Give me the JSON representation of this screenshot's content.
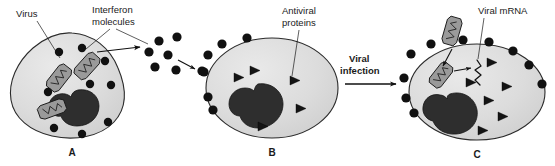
{
  "figure": {
    "background_color": "#ffffff",
    "width": 555,
    "height": 166
  },
  "labels": {
    "virus": "Virus",
    "interferon_line1": "Interferon",
    "interferon_line2": "molecules",
    "antiviral_line1": "Antiviral",
    "antiviral_line2": "proteins",
    "viral_infection_line1": "Viral",
    "viral_infection_line2": "infection",
    "viral_mrna": "Viral mRNA"
  },
  "panels": [
    {
      "letter": "A",
      "name": "infected-cell-producing-interferon",
      "cytoplasm_color": "#d9d9d9",
      "nucleus_color": "#2e2e2e",
      "virus_count": 3,
      "interferon_dot_count": 9,
      "antiviral_triangle_count": 0
    },
    {
      "letter": "B",
      "name": "neighbor-cell-receiving-interferon",
      "cytoplasm_color": "#d9d9d9",
      "nucleus_color": "#2e2e2e",
      "virus_count": 0,
      "interferon_dot_count": 6,
      "antiviral_triangle_count": 5
    },
    {
      "letter": "C",
      "name": "protected-cell-after-viral-infection",
      "cytoplasm_color": "#d9d9d9",
      "nucleus_color": "#2e2e2e",
      "virus_count": 2,
      "interferon_dot_count": 10,
      "antiviral_triangle_count": 6
    }
  ],
  "colors": {
    "outline": "#2b2b2b",
    "dot": "#111111",
    "triangle": "#141414",
    "capsid_fill": "#9a9a9a",
    "text": "#1a1a1a"
  }
}
